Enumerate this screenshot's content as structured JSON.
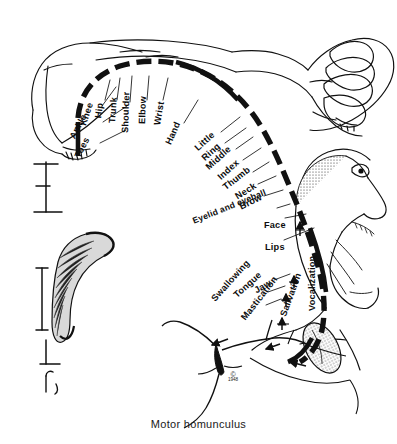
{
  "figure": {
    "caption": "Motor homunculus",
    "copyright_mark": "©",
    "copyright_year": "1948",
    "background_color": "#ffffff",
    "ink_color": "#111111"
  },
  "cortex_band": {
    "name": "motor cortex strip",
    "style": "thick dashed arc"
  },
  "labels": [
    {
      "text": "Toes",
      "x": 77,
      "y": 152,
      "angle": -62,
      "leader": {
        "x1": 100,
        "y1": 143,
        "x2": 126,
        "y2": 130
      }
    },
    {
      "text": "Ankle",
      "x": 72,
      "y": 133,
      "angle": -62,
      "leader": {
        "x1": 103,
        "y1": 122,
        "x2": 127,
        "y2": 106
      }
    },
    {
      "text": "Knee",
      "x": 83,
      "y": 120,
      "angle": -72,
      "leader": {
        "x1": 102,
        "y1": 106,
        "x2": 116,
        "y2": 87
      }
    },
    {
      "text": "Hip",
      "x": 98,
      "y": 113,
      "angle": -82,
      "leader": {
        "x1": 105,
        "y1": 100,
        "x2": 110,
        "y2": 80
      }
    },
    {
      "text": "Trunk",
      "x": 112,
      "y": 118,
      "angle": -86,
      "leader": {
        "x1": 117,
        "y1": 100,
        "x2": 120,
        "y2": 78
      }
    },
    {
      "text": "Shoulder",
      "x": 125,
      "y": 128,
      "angle": -88,
      "leader": {
        "x1": 130,
        "y1": 102,
        "x2": 132,
        "y2": 76
      }
    },
    {
      "text": "Elbow",
      "x": 142,
      "y": 119,
      "angle": -88,
      "leader": {
        "x1": 147,
        "y1": 100,
        "x2": 149,
        "y2": 76
      }
    },
    {
      "text": "Wrist",
      "x": 157,
      "y": 120,
      "angle": -80,
      "leader": {
        "x1": 163,
        "y1": 100,
        "x2": 168,
        "y2": 78
      }
    },
    {
      "text": "Hand",
      "x": 168,
      "y": 139,
      "angle": -66,
      "leader": {
        "x1": 184,
        "y1": 123,
        "x2": 198,
        "y2": 100
      }
    },
    {
      "text": "Little",
      "x": 196,
      "y": 144,
      "angle": -42,
      "leader": {
        "x1": 221,
        "y1": 132,
        "x2": 240,
        "y2": 117
      }
    },
    {
      "text": "Ring",
      "x": 203,
      "y": 154,
      "angle": -42,
      "leader": {
        "x1": 225,
        "y1": 143,
        "x2": 246,
        "y2": 128
      }
    },
    {
      "text": "Middle",
      "x": 207,
      "y": 163,
      "angle": -42,
      "leader": {
        "x1": 236,
        "y1": 149,
        "x2": 253,
        "y2": 137
      }
    },
    {
      "text": "Index",
      "x": 219,
      "y": 173,
      "angle": -42,
      "leader": {
        "x1": 243,
        "y1": 160,
        "x2": 261,
        "y2": 148
      }
    },
    {
      "text": "Thumb",
      "x": 224,
      "y": 183,
      "angle": -38,
      "leader": {
        "x1": 253,
        "y1": 172,
        "x2": 269,
        "y2": 162
      }
    },
    {
      "text": "Neck",
      "x": 236,
      "y": 192,
      "angle": -32,
      "leader": {
        "x1": 258,
        "y1": 184,
        "x2": 276,
        "y2": 176
      }
    },
    {
      "text": "Brow",
      "x": 240,
      "y": 202,
      "angle": -26,
      "leader": {
        "x1": 264,
        "y1": 196,
        "x2": 283,
        "y2": 190
      }
    },
    {
      "text": "Eyelid and eyeball",
      "x": 193,
      "y": 216,
      "angle": -22,
      "leader": {
        "x1": 277,
        "y1": 208,
        "x2": 290,
        "y2": 204
      }
    },
    {
      "text": "Face",
      "x": 264,
      "y": 220,
      "angle": 0,
      "leader": {
        "x1": 285,
        "y1": 218,
        "x2": 306,
        "y2": 214
      }
    },
    {
      "text": "Lips",
      "x": 265,
      "y": 242,
      "angle": 0,
      "leader": {
        "x1": 284,
        "y1": 240,
        "x2": 314,
        "y2": 228
      }
    },
    {
      "text": "Vocalization",
      "x": 312,
      "y": 306,
      "angle": -90,
      "leader": null
    },
    {
      "text": "Jaw",
      "x": 255,
      "y": 286,
      "angle": -30,
      "leader": {
        "x1": 274,
        "y1": 280,
        "x2": 290,
        "y2": 274
      }
    },
    {
      "text": "Tongue",
      "x": 235,
      "y": 291,
      "angle": -42,
      "leader": {
        "x1": 268,
        "y1": 292,
        "x2": 285,
        "y2": 286
      }
    },
    {
      "text": "Swallowing",
      "x": 213,
      "y": 295,
      "angle": -48,
      "leader": {
        "x1": 266,
        "y1": 305,
        "x2": 281,
        "y2": 299
      }
    },
    {
      "text": "Mastication",
      "x": 243,
      "y": 314,
      "angle": -52,
      "leader": {
        "x1": 228,
        "y1": 339,
        "x2": 214,
        "y2": 344
      }
    },
    {
      "text": "Salivation",
      "x": 283,
      "y": 311,
      "angle": -70,
      "leader": {
        "x1": 280,
        "y1": 344,
        "x2": 268,
        "y2": 348
      }
    }
  ],
  "drawing_parts": [
    {
      "name": "reclining-body-figure",
      "region": "top-left"
    },
    {
      "name": "clenched-fist-figure",
      "region": "top-right"
    },
    {
      "name": "face-profile-figure",
      "region": "right"
    },
    {
      "name": "tongue-figure",
      "region": "lower-right"
    },
    {
      "name": "pyramidal-neuron-figure",
      "region": "bottom-center"
    },
    {
      "name": "gyrus-cross-section",
      "region": "left"
    },
    {
      "name": "scale-bar-upper",
      "region": "left"
    },
    {
      "name": "scale-bar-lower",
      "region": "left"
    }
  ]
}
